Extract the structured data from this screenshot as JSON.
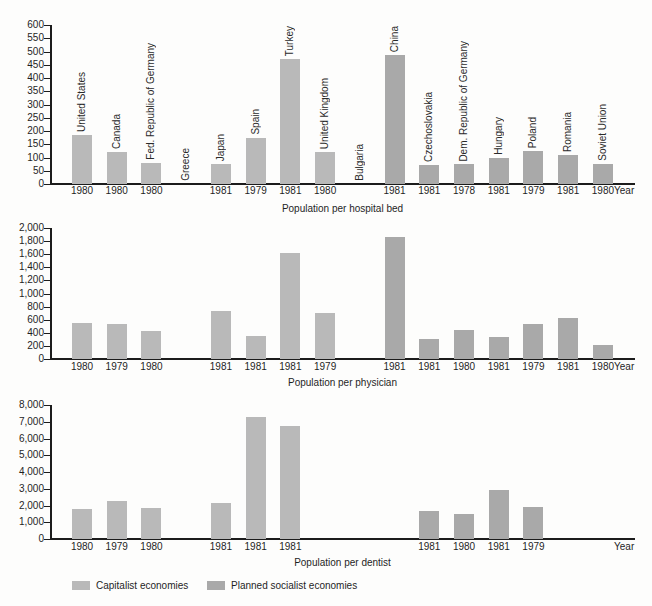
{
  "figure": {
    "kind": "scanned-statistics-figure",
    "background": "#fdfdfc",
    "axis_color": "#1c1c1c"
  },
  "legend": {
    "position": "bottom",
    "items": [
      {
        "label": "Capitalist economies",
        "color": "#b9b9b9",
        "group": "capitalist"
      },
      {
        "label": "Planned socialist economies",
        "color": "#a9a9a9",
        "group": "socialist"
      }
    ]
  },
  "chart_data": [
    {
      "type": "bar",
      "title": "Population per hospital bed",
      "xlabel": "Year",
      "ylabel": "",
      "ylim": [
        0,
        600
      ],
      "grid": false,
      "show_country_labels": true,
      "yticks": [
        "0",
        "50",
        "100",
        "150",
        "200",
        "250",
        "300",
        "350",
        "400",
        "450",
        "500",
        "550",
        "600"
      ],
      "bars": [
        {
          "country": "United States",
          "year": "1980",
          "value": 185,
          "group": "capitalist"
        },
        {
          "country": "Canada",
          "year": "1980",
          "value": 120,
          "group": "capitalist"
        },
        {
          "country": "Fed. Republic of Germany",
          "year": "1980",
          "value": 80,
          "group": "capitalist"
        },
        {
          "country": "Greece",
          "year": "",
          "value": null,
          "group": "capitalist"
        },
        {
          "country": "Japan",
          "year": "1981",
          "value": 75,
          "group": "capitalist"
        },
        {
          "country": "Spain",
          "year": "1979",
          "value": 175,
          "group": "capitalist"
        },
        {
          "country": "Turkey",
          "year": "1981",
          "value": 470,
          "group": "capitalist"
        },
        {
          "country": "United Kingdom",
          "year": "1980",
          "value": 120,
          "group": "capitalist"
        },
        {
          "country": "Bulgaria",
          "year": "",
          "value": null,
          "group": "socialist"
        },
        {
          "country": "China",
          "year": "1981",
          "value": 485,
          "group": "socialist"
        },
        {
          "country": "Czechoslovakia",
          "year": "1981",
          "value": 70,
          "group": "socialist"
        },
        {
          "country": "Dem. Republic of Germany",
          "year": "1978",
          "value": 75,
          "group": "socialist"
        },
        {
          "country": "Hungary",
          "year": "1981",
          "value": 100,
          "group": "socialist"
        },
        {
          "country": "Poland",
          "year": "1979",
          "value": 125,
          "group": "socialist"
        },
        {
          "country": "Romania",
          "year": "1981",
          "value": 110,
          "group": "socialist"
        },
        {
          "country": "Soviet Union",
          "year": "1980",
          "value": 75,
          "group": "socialist"
        }
      ]
    },
    {
      "type": "bar",
      "title": "Population per physician",
      "xlabel": "Year",
      "ylabel": "",
      "ylim": [
        0,
        2000
      ],
      "grid": false,
      "show_country_labels": false,
      "yticks": [
        "0",
        "200",
        "400",
        "600",
        "800",
        "1,000",
        "1,200",
        "1,400",
        "1,600",
        "1,800",
        "2,000"
      ],
      "bars": [
        {
          "country": "United States",
          "year": "1980",
          "value": 545,
          "group": "capitalist"
        },
        {
          "country": "Canada",
          "year": "1979",
          "value": 530,
          "group": "capitalist"
        },
        {
          "country": "Fed. Republic of Germany",
          "year": "1980",
          "value": 430,
          "group": "capitalist"
        },
        {
          "country": "Greece",
          "year": "",
          "value": null,
          "group": "capitalist"
        },
        {
          "country": "Japan",
          "year": "1981",
          "value": 740,
          "group": "capitalist"
        },
        {
          "country": "Spain",
          "year": "1981",
          "value": 350,
          "group": "capitalist"
        },
        {
          "country": "Turkey",
          "year": "1981",
          "value": 1620,
          "group": "capitalist"
        },
        {
          "country": "United Kingdom",
          "year": "1979",
          "value": 700,
          "group": "capitalist"
        },
        {
          "country": "Bulgaria",
          "year": "",
          "value": null,
          "group": "socialist"
        },
        {
          "country": "China",
          "year": "1981",
          "value": 1870,
          "group": "socialist"
        },
        {
          "country": "Czechoslovakia",
          "year": "1981",
          "value": 300,
          "group": "socialist"
        },
        {
          "country": "Dem. Republic of Germany",
          "year": "1980",
          "value": 450,
          "group": "socialist"
        },
        {
          "country": "Hungary",
          "year": "1981",
          "value": 340,
          "group": "socialist"
        },
        {
          "country": "Poland",
          "year": "1979",
          "value": 530,
          "group": "socialist"
        },
        {
          "country": "Romania",
          "year": "1981",
          "value": 620,
          "group": "socialist"
        },
        {
          "country": "Soviet Union",
          "year": "1980",
          "value": 210,
          "group": "socialist"
        }
      ]
    },
    {
      "type": "bar",
      "title": "Population per dentist",
      "xlabel": "Year",
      "ylabel": "",
      "ylim": [
        0,
        8000
      ],
      "grid": false,
      "show_country_labels": false,
      "yticks": [
        "0",
        "1,000",
        "2,000",
        "3,000",
        "4,000",
        "5,000",
        "6,000",
        "7,000",
        "8,000"
      ],
      "bars": [
        {
          "country": "United States",
          "year": "1980",
          "value": 1800,
          "group": "capitalist"
        },
        {
          "country": "Canada",
          "year": "1979",
          "value": 2250,
          "group": "capitalist"
        },
        {
          "country": "Fed. Republic of Germany",
          "year": "1980",
          "value": 1850,
          "group": "capitalist"
        },
        {
          "country": "Greece",
          "year": "",
          "value": null,
          "group": "capitalist"
        },
        {
          "country": "Japan",
          "year": "1981",
          "value": 2150,
          "group": "capitalist"
        },
        {
          "country": "Spain",
          "year": "1981",
          "value": 7300,
          "group": "capitalist"
        },
        {
          "country": "Turkey",
          "year": "1981",
          "value": 6750,
          "group": "capitalist"
        },
        {
          "country": "United Kingdom",
          "year": "",
          "value": null,
          "group": "capitalist"
        },
        {
          "country": "Bulgaria",
          "year": "",
          "value": null,
          "group": "socialist"
        },
        {
          "country": "China",
          "year": "",
          "value": null,
          "group": "socialist"
        },
        {
          "country": "Czechoslovakia",
          "year": "1981",
          "value": 1700,
          "group": "socialist"
        },
        {
          "country": "Dem. Republic of Germany",
          "year": "1980",
          "value": 1500,
          "group": "socialist"
        },
        {
          "country": "Hungary",
          "year": "1981",
          "value": 2900,
          "group": "socialist"
        },
        {
          "country": "Poland",
          "year": "1979",
          "value": 1900,
          "group": "socialist"
        },
        {
          "country": "Romania",
          "year": "",
          "value": null,
          "group": "socialist"
        },
        {
          "country": "Soviet Union",
          "year": "",
          "value": null,
          "group": "socialist"
        }
      ]
    }
  ]
}
